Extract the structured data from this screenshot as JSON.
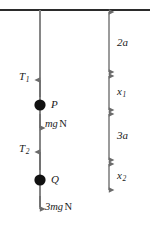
{
  "diagram": {
    "type": "free-body-force-diagram",
    "background_color": "#ffffff",
    "stroke_color": "#6b6b6b",
    "ceiling_color": "#2b2b2b",
    "particle_color": "#111111",
    "text_color": "#1a1a1a",
    "ceiling": {
      "label": "ceiling",
      "x1": 0,
      "x2": 150,
      "y": 10
    },
    "string": {
      "label": "string",
      "x": 40,
      "y_top": 10,
      "y_bottom": 207
    },
    "particles": [
      {
        "name": "P",
        "label": "P",
        "x": 40,
        "y": 105,
        "radius": 5.5
      },
      {
        "name": "Q",
        "label": "Q",
        "x": 40,
        "y": 180,
        "radius": 5.5
      }
    ],
    "forces": [
      {
        "name": "tension-upper",
        "symbol": "T",
        "subscript": "1",
        "unit": "",
        "direction": "up",
        "arrow_x": 40,
        "arrow_tip_y": 78,
        "arrow_tail_y": 97,
        "label_x": 19,
        "label_y": 71
      },
      {
        "name": "weight-P",
        "symbol": "mg",
        "subscript": "",
        "unit": "N",
        "direction": "down",
        "arrow_x": 40,
        "arrow_tip_y": 130,
        "arrow_tail_y": 114,
        "label_x": 45,
        "label_y": 119
      },
      {
        "name": "tension-lower",
        "symbol": "T",
        "subscript": "2",
        "unit": "",
        "direction": "up",
        "arrow_x": 40,
        "arrow_tip_y": 150,
        "arrow_tail_y": 170,
        "label_x": 19,
        "label_y": 143
      },
      {
        "name": "weight-Q",
        "symbol": "3mg",
        "subscript": "",
        "unit": "N",
        "direction": "down",
        "arrow_x": 40,
        "arrow_tip_y": 211,
        "arrow_tail_y": 196,
        "label_x": 45,
        "label_y": 202
      }
    ],
    "dimension_line_x": 109,
    "dimensions": [
      {
        "name": "dimension-2a",
        "symbol": "2a",
        "base": "2a",
        "subscript": "",
        "y_top": 12,
        "y_bottom": 72,
        "label_x": 117,
        "label_y": 37
      },
      {
        "name": "dimension-x1",
        "symbol": "x1",
        "base": "x",
        "subscript": "1",
        "y_top": 76,
        "y_bottom": 110,
        "label_x": 117,
        "label_y": 86
      },
      {
        "name": "dimension-3a",
        "symbol": "3a",
        "base": "3a",
        "subscript": "",
        "y_top": 114,
        "y_bottom": 160,
        "label_x": 117,
        "label_y": 130
      },
      {
        "name": "dimension-x2",
        "symbol": "x2",
        "base": "x",
        "subscript": "2",
        "y_top": 164,
        "y_bottom": 190,
        "label_x": 117,
        "label_y": 170
      }
    ]
  },
  "labels": {
    "T1_base": "T",
    "T1_sub": "1",
    "T2_base": "T",
    "T2_sub": "2",
    "P": "P",
    "Q": "Q",
    "mg_base": "mg",
    "mg_unit": "N",
    "three_mg_base": "3mg",
    "three_mg_unit": "N",
    "two_a": "2a",
    "x1_base": "x",
    "x1_sub": "1",
    "three_a": "3a",
    "x2_base": "x",
    "x2_sub": "2"
  }
}
